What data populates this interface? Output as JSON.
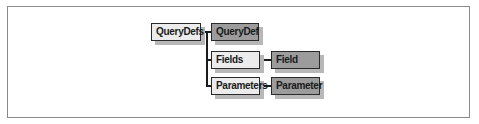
{
  "diagram": {
    "type": "object-hierarchy",
    "nodes": [
      {
        "id": "querydefs",
        "label": "QueryDefs",
        "kind": "collection"
      },
      {
        "id": "querydef",
        "label": "QueryDef",
        "kind": "object"
      },
      {
        "id": "fields",
        "label": "Fields",
        "kind": "collection"
      },
      {
        "id": "field",
        "label": "Field",
        "kind": "object"
      },
      {
        "id": "parameters",
        "label": "Parameters",
        "kind": "collection"
      },
      {
        "id": "parameter",
        "label": "Parameter",
        "kind": "object"
      }
    ],
    "edges": [
      {
        "from": "querydefs",
        "to": "querydef"
      },
      {
        "from": "querydef",
        "to": "fields"
      },
      {
        "from": "querydef",
        "to": "parameters"
      },
      {
        "from": "fields",
        "to": "field"
      },
      {
        "from": "parameters",
        "to": "parameter"
      }
    ],
    "colors": {
      "collection_fill": "#ececec",
      "object_fill": "#9c9c9c",
      "border": "#2a2a2a",
      "shadow": "#b8b8b8",
      "frame": "#8a8a8a"
    }
  }
}
